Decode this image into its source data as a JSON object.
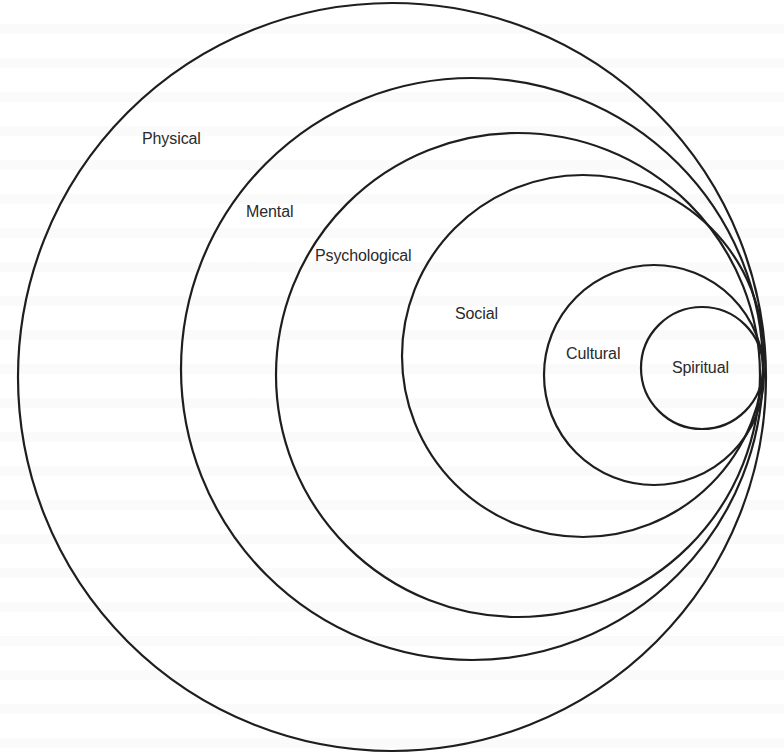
{
  "diagram": {
    "type": "nested-tangent-circles",
    "stroke_color": "#1e1e1e",
    "text_color": "#2a2a2a",
    "background": "#ffffff",
    "layers": [
      {
        "label": "Physical",
        "cx": 392,
        "cy": 377,
        "r": 374,
        "label_x": 142,
        "label_y": 131
      },
      {
        "label": "Mental",
        "cx": 472,
        "cy": 369,
        "r": 291,
        "label_x": 246,
        "label_y": 204
      },
      {
        "label": "Psychological",
        "cx": 518,
        "cy": 375,
        "r": 242,
        "label_x": 315,
        "label_y": 248
      },
      {
        "label": "Social",
        "cx": 583,
        "cy": 356,
        "r": 181,
        "label_x": 455,
        "label_y": 306
      },
      {
        "label": "Cultural",
        "cx": 654,
        "cy": 375,
        "r": 110,
        "label_x": 566,
        "label_y": 346
      },
      {
        "label": "Spiritual",
        "cx": 702,
        "cy": 368,
        "r": 61,
        "label_x": 672,
        "label_y": 360
      }
    ]
  }
}
